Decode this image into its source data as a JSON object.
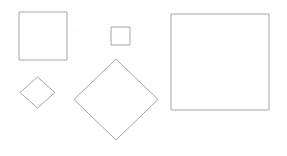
{
  "scene": {
    "title": "Geometric shapes figure",
    "background_color": "#ffffff",
    "stroke_color": "#a6a6a6",
    "stroke_width": 1,
    "fill": "none",
    "width": 287,
    "height": 156,
    "shape_count": 5,
    "shape_kinds": [
      "square",
      "square",
      "square",
      "diamond",
      "diamond"
    ]
  },
  "shapes": [
    {
      "id": "square-medium-left",
      "kind": "square",
      "label": "medium square",
      "rotation_deg": 0,
      "x": 19,
      "y": 12,
      "width": 48,
      "height": 48,
      "center_x": 43,
      "center_y": 36,
      "side": 48
    },
    {
      "id": "square-small-top",
      "kind": "square",
      "label": "small square",
      "rotation_deg": 0,
      "x": 111,
      "y": 27,
      "width": 19,
      "height": 18,
      "center_x": 120.5,
      "center_y": 36,
      "side": 19
    },
    {
      "id": "square-large-right",
      "kind": "square",
      "label": "large square",
      "rotation_deg": 0,
      "x": 171,
      "y": 14,
      "width": 98,
      "height": 96,
      "center_x": 220,
      "center_y": 62,
      "side": 97
    },
    {
      "id": "diamond-small-left",
      "kind": "diamond",
      "label": "small rotated square",
      "rotation_deg": 45,
      "center_x": 37.5,
      "center_y": 92.5,
      "half_width": 17.5,
      "half_height": 15.5,
      "points": "20,92.5 37.5,77 55,92.5 37.5,108"
    },
    {
      "id": "diamond-large-center",
      "kind": "diamond",
      "label": "large rotated square",
      "rotation_deg": 45,
      "center_x": 116,
      "center_y": 99.5,
      "half_width": 42,
      "half_height": 40.5,
      "points": "74,99.5 116,59 158,99.5 116,140"
    }
  ],
  "marks": [
    {
      "id": "faint-speck-a",
      "x": 74,
      "y": 30,
      "w": 1,
      "h": 1
    },
    {
      "id": "faint-speck-b",
      "x": 77,
      "y": 31,
      "w": 1,
      "h": 1
    }
  ]
}
